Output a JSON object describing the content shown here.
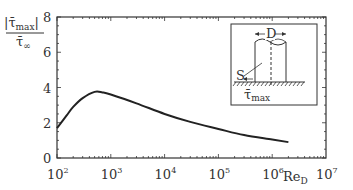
{
  "chart_data": {
    "type": "line",
    "title": "",
    "xlabel": "Re_D",
    "ylabel": "|τ̄max| / τ̄∞",
    "xscale": "log",
    "xlim": [
      100,
      10000000
    ],
    "ylim": [
      0,
      8
    ],
    "x_ticks": [
      {
        "base": "10",
        "exp": "2"
      },
      {
        "base": "10",
        "exp": "3"
      },
      {
        "base": "10",
        "exp": "4"
      },
      {
        "base": "10",
        "exp": "5"
      },
      {
        "base": "10",
        "exp": "6"
      },
      {
        "base": "10",
        "exp": "7"
      }
    ],
    "y_ticks": [
      "0",
      "2",
      "4",
      "6",
      "8"
    ],
    "grid": false,
    "legend": null,
    "series": [
      {
        "name": "tau_max ratio",
        "x": [
          100,
          150,
          200,
          300,
          500,
          700,
          1000,
          3000,
          10000,
          30000,
          100000,
          300000,
          1000000,
          2000000
        ],
        "y": [
          1.7,
          2.4,
          2.9,
          3.4,
          3.75,
          3.72,
          3.6,
          3.1,
          2.5,
          2.05,
          1.65,
          1.3,
          1.05,
          0.9
        ]
      }
    ],
    "inset": {
      "labels": {
        "diameter": "D",
        "point": "S",
        "shear": "τ̄",
        "shear_sub": "max"
      }
    }
  },
  "axes": {
    "ylabel_num": "|τ̄",
    "ylabel_num_sub": "max",
    "ylabel_num_end": "|",
    "ylabel_den": "τ̄",
    "ylabel_den_sub": "∞",
    "xlabel_main": "Re",
    "xlabel_sub": "D"
  }
}
